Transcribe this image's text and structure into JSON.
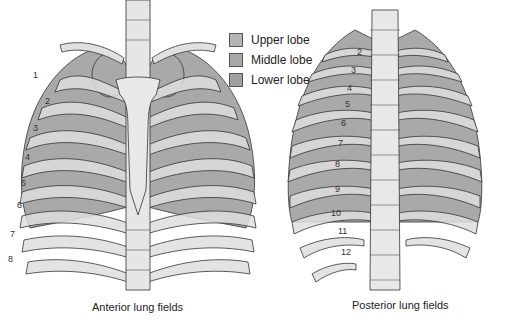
{
  "legend": {
    "items": [
      {
        "label": "Upper lobe",
        "color": "#b4b4b4"
      },
      {
        "label": "Middle lobe",
        "color": "#a8a8a8"
      },
      {
        "label": "Lower lobe",
        "color": "#a0a0a0"
      }
    ]
  },
  "anterior": {
    "caption": "Anterior lung fields",
    "rib_numbers": [
      "1",
      "2",
      "3",
      "4",
      "5",
      "6",
      "7",
      "8"
    ]
  },
  "posterior": {
    "caption": "Posterior lung fields",
    "rib_numbers": [
      "2",
      "3",
      "4",
      "5",
      "6",
      "7",
      "8",
      "9",
      "10",
      "11",
      "12"
    ]
  },
  "colors": {
    "lung": "#a9a9a9",
    "bone": "#dedede",
    "outline": "#333333",
    "background": "#ffffff"
  }
}
